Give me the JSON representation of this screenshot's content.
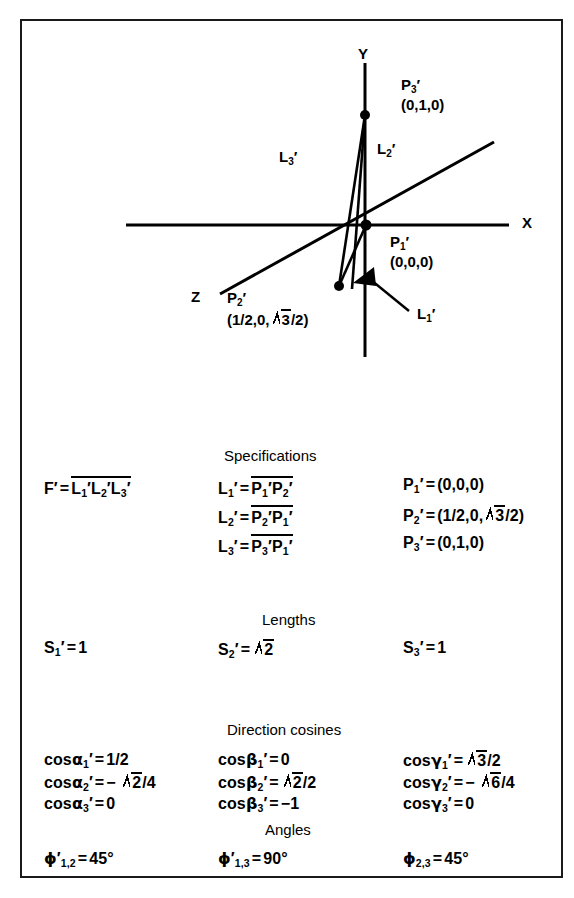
{
  "figure": {
    "border_color": "#1a1a1a",
    "background": "#ffffff"
  },
  "diagram": {
    "type": "3d-coordinate-axes-triangle",
    "axes": [
      {
        "name": "x-axis",
        "label": "X"
      },
      {
        "name": "y-axis",
        "label": "Y"
      },
      {
        "name": "z-axis",
        "label": "Z"
      }
    ],
    "points": [
      {
        "name": "P1",
        "label": "P",
        "sub": "1",
        "prime": "′",
        "coords": "(0,0,0)"
      },
      {
        "name": "P2",
        "label": "P",
        "sub": "2",
        "prime": "′",
        "coords": "(1/2,0,√3/2)"
      },
      {
        "name": "P3",
        "label": "P",
        "sub": "3",
        "prime": "′",
        "coords": "(0,1,0)"
      }
    ],
    "edges": [
      {
        "name": "L1",
        "label": "L",
        "sub": "1",
        "prime": "′"
      },
      {
        "name": "L2",
        "label": "L",
        "sub": "2",
        "prime": "′"
      },
      {
        "name": "L3",
        "label": "L",
        "sub": "3",
        "prime": "′"
      }
    ]
  },
  "sections": {
    "specifications": {
      "heading": "Specifications",
      "left": {
        "lhs": "F′",
        "eq": "=",
        "rhs_overline": "L₁′L₂′L₃′"
      },
      "middle": [
        {
          "lhs_base": "L",
          "lhs_sub": "1",
          "rhs_a": "P",
          "rhs_a_sub": "1",
          "rhs_b": "P",
          "rhs_b_sub": "2"
        },
        {
          "lhs_base": "L",
          "lhs_sub": "2",
          "rhs_a": "P",
          "rhs_a_sub": "2",
          "rhs_b": "P",
          "rhs_b_sub": "1"
        },
        {
          "lhs_base": "L",
          "lhs_sub": "3",
          "rhs_a": "P",
          "rhs_a_sub": "3",
          "rhs_b": "P",
          "rhs_b_sub": "1"
        }
      ],
      "right": [
        {
          "base": "P",
          "sub": "1",
          "value": "(0,0,0)"
        },
        {
          "base": "P",
          "sub": "2",
          "value_pre": "(1/2,0,",
          "value_radicand": "3",
          "value_post": "/2)"
        },
        {
          "base": "P",
          "sub": "3",
          "value": "(0,1,0)"
        }
      ]
    },
    "lengths": {
      "heading": "Lengths",
      "items": [
        {
          "base": "S",
          "sub": "1",
          "value": "1"
        },
        {
          "base": "S",
          "sub": "2",
          "value_radicand": "2"
        },
        {
          "base": "S",
          "sub": "3",
          "value": "1"
        }
      ]
    },
    "direction_cosines": {
      "heading": "Direction cosines",
      "columns": [
        {
          "name": "alpha",
          "rows": [
            {
              "fn": "cos",
              "greek": "α",
              "sub": "1",
              "value": "1/2"
            },
            {
              "fn": "cos",
              "greek": "α",
              "sub": "2",
              "sign": "−",
              "value_radicand": "2",
              "value_post": "/4"
            },
            {
              "fn": "cos",
              "greek": "α",
              "sub": "3",
              "value": "0"
            }
          ]
        },
        {
          "name": "beta",
          "rows": [
            {
              "fn": "cos",
              "greek": "β",
              "sub": "1",
              "value": "0"
            },
            {
              "fn": "cos",
              "greek": "β",
              "sub": "2",
              "value_radicand": "2",
              "value_post": "/2"
            },
            {
              "fn": "cos",
              "greek": "β",
              "sub": "3",
              "value": "−1"
            }
          ]
        },
        {
          "name": "gamma",
          "rows": [
            {
              "fn": "cos",
              "greek": "γ",
              "sub": "1",
              "value_radicand": "3",
              "value_post": "/2"
            },
            {
              "fn": "cos",
              "greek": "γ",
              "sub": "2",
              "sign": "−",
              "value_radicand": "6",
              "value_post": "/4"
            },
            {
              "fn": "cos",
              "greek": "γ",
              "sub": "3",
              "value": "0"
            }
          ]
        }
      ]
    },
    "angles": {
      "heading": "Angles",
      "items": [
        {
          "greek": "ϕ",
          "prime": "′",
          "sub": "1,2",
          "value": "45°"
        },
        {
          "greek": "ϕ",
          "prime": "′",
          "sub": "1,3",
          "value": "90°"
        },
        {
          "greek": "ϕ",
          "prime": "",
          "sub": "2,3",
          "value": "45°"
        }
      ]
    }
  }
}
